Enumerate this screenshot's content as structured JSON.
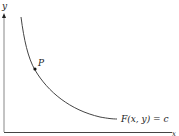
{
  "diagram": {
    "axes": {
      "y_label": "y",
      "x_label": "x"
    },
    "curve": {
      "label": "F(x, y) = c"
    },
    "point": {
      "label": "P"
    },
    "colors": {
      "stroke": "#333333",
      "background": "#ffffff"
    }
  }
}
